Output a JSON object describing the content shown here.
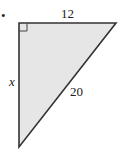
{
  "figure": {
    "type": "right-triangle",
    "fill_color": "#e6e6e6",
    "stroke_color": "#333333",
    "bullet": "•",
    "labels": {
      "top_side": "12",
      "left_side": "x",
      "hypotenuse": "20"
    },
    "right_angle_marker": "top-left"
  }
}
